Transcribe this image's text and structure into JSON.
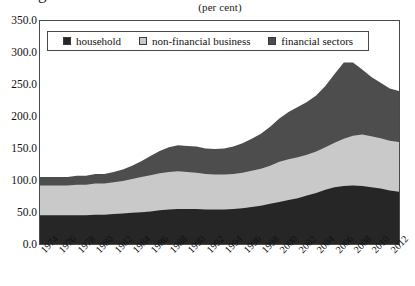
{
  "title_clipped": "g",
  "subtitle": "(per cent)",
  "legend": {
    "items": [
      {
        "label": "household",
        "color": "#262626"
      },
      {
        "label": "non-financial business",
        "color": "#c9c9c9"
      },
      {
        "label": "financial sectors",
        "color": "#4d4d4d"
      }
    ]
  },
  "axes": {
    "y_ticks": [
      "350.0",
      "300.0",
      "250.0",
      "200.0",
      "150.0",
      "100.0",
      "50.0",
      "0.0"
    ],
    "x_ticks": [
      "1974",
      "1976",
      "1978",
      "1980",
      "1982",
      "1984",
      "1986",
      "1988",
      "1990",
      "1992",
      "1994",
      "1996",
      "1998",
      "2000",
      "2002",
      "2004",
      "2006",
      "2008",
      "2010",
      "2012"
    ]
  },
  "chart_data": {
    "type": "area",
    "title": "(per cent)",
    "subtitle": "(per cent)",
    "xlabel": "",
    "ylabel": "",
    "ylim": [
      0,
      350
    ],
    "xlim": [
      1974,
      2013
    ],
    "grid": false,
    "stacked": true,
    "legend_position": "top-inside",
    "tick_labels": {
      "y": [
        "0.0",
        "50.0",
        "100.0",
        "150.0",
        "200.0",
        "250.0",
        "300.0",
        "350.0"
      ],
      "x": [
        "1974",
        "1976",
        "1978",
        "1980",
        "1982",
        "1984",
        "1986",
        "1988",
        "1990",
        "1992",
        "1994",
        "1996",
        "1998",
        "2000",
        "2002",
        "2004",
        "2006",
        "2008",
        "2010",
        "2012"
      ]
    },
    "x": [
      1974,
      1975,
      1976,
      1977,
      1978,
      1979,
      1980,
      1981,
      1982,
      1983,
      1984,
      1985,
      1986,
      1987,
      1988,
      1989,
      1990,
      1991,
      1992,
      1993,
      1994,
      1995,
      1996,
      1997,
      1998,
      1999,
      2000,
      2001,
      2002,
      2003,
      2004,
      2005,
      2006,
      2007,
      2008,
      2009,
      2010,
      2011,
      2012,
      2013
    ],
    "series": [
      {
        "name": "household",
        "color": "#262626",
        "values": [
          45,
          45,
          45,
          45,
          45,
          45,
          46,
          46,
          47,
          48,
          49,
          50,
          51,
          53,
          54,
          55,
          55,
          55,
          54,
          54,
          54,
          55,
          56,
          58,
          60,
          63,
          66,
          69,
          72,
          76,
          80,
          85,
          89,
          91,
          92,
          91,
          89,
          87,
          84,
          82
        ]
      },
      {
        "name": "non-financial business",
        "color": "#c9c9c9",
        "values": [
          47,
          47,
          47,
          47,
          48,
          48,
          49,
          49,
          50,
          51,
          53,
          55,
          57,
          58,
          59,
          59,
          58,
          57,
          56,
          55,
          55,
          55,
          56,
          57,
          58,
          60,
          63,
          64,
          64,
          64,
          65,
          67,
          70,
          74,
          78,
          81,
          80,
          79,
          78,
          78
        ]
      },
      {
        "name": "financial sectors",
        "color": "#4d4d4d",
        "values": [
          13,
          13,
          13,
          13,
          14,
          14,
          15,
          15,
          16,
          18,
          21,
          25,
          30,
          35,
          39,
          41,
          41,
          41,
          40,
          40,
          41,
          43,
          46,
          50,
          55,
          61,
          68,
          74,
          79,
          83,
          88,
          96,
          108,
          120,
          115,
          102,
          93,
          87,
          82,
          80
        ]
      }
    ],
    "totals": [
      105,
      105,
      105,
      105,
      107,
      107,
      110,
      110,
      113,
      117,
      123,
      130,
      138,
      146,
      152,
      155,
      154,
      153,
      150,
      149,
      150,
      153,
      158,
      165,
      173,
      184,
      197,
      207,
      215,
      223,
      233,
      248,
      267,
      285,
      285,
      274,
      262,
      253,
      244,
      240
    ]
  }
}
